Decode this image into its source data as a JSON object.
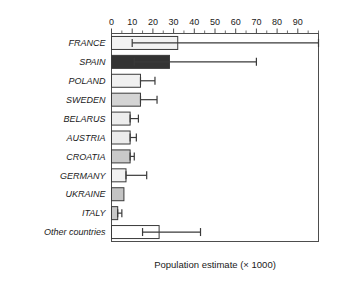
{
  "chart_data": {
    "type": "bar",
    "orientation": "horizontal",
    "title": "",
    "xlabel": "Population estimate (× 1000)",
    "ylabel": "",
    "xlim": [
      0,
      100
    ],
    "ylim": null,
    "grid": false,
    "legend": null,
    "xticks": [
      0,
      10,
      20,
      30,
      40,
      50,
      60,
      70,
      80,
      90
    ],
    "xtick_labels": [
      "0",
      "10",
      "20",
      "30",
      "40",
      "50",
      "60",
      "70",
      "80",
      "90"
    ],
    "minor_tick_step": 5,
    "axis_position": "top",
    "categories": [
      "FRANCE",
      "SPAIN",
      "POLAND",
      "SWEDEN",
      "BELARUS",
      "AUSTRIA",
      "CROATIA",
      "GERMANY",
      "UKRAINE",
      "ITALY",
      "Other countries"
    ],
    "values": [
      32,
      28,
      14,
      14,
      9,
      9,
      9,
      7,
      6,
      3,
      23
    ],
    "error_low": [
      10,
      11,
      14,
      14,
      9,
      9,
      9,
      7,
      6,
      3,
      15
    ],
    "error_high": [
      100,
      70,
      21,
      22,
      13,
      12,
      11,
      17,
      6,
      5,
      43
    ],
    "bar_colors": [
      "#f2f2f2",
      "#333333",
      "#f0f0f0",
      "#d4d4d4",
      "#ededed",
      "#ececec",
      "#c9c9c9",
      "#f2f2f2",
      "#c4c4c4",
      "#c9c9c9",
      "#ffffff"
    ],
    "bar_edge_color": "#3a3a3a",
    "error_bar_color": "#3a3a3a",
    "frame_color": "#4d4d4d",
    "background_color": "#ffffff",
    "text_color": "#1a1a1a"
  }
}
